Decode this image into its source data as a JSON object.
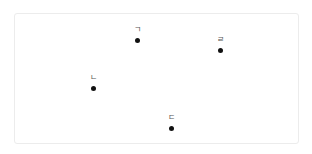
{
  "diagram": {
    "type": "labeled-points",
    "frame": {
      "border_color": "#ececec"
    },
    "points": [
      {
        "label": "ㄱ",
        "x": 137,
        "y": 40
      },
      {
        "label": "ㄴ",
        "x": 93,
        "y": 88
      },
      {
        "label": "ㄷ",
        "x": 171,
        "y": 128
      },
      {
        "label": "ㄹ",
        "x": 220,
        "y": 50
      }
    ],
    "dot_color": "#111111",
    "label_color": "#555555"
  }
}
